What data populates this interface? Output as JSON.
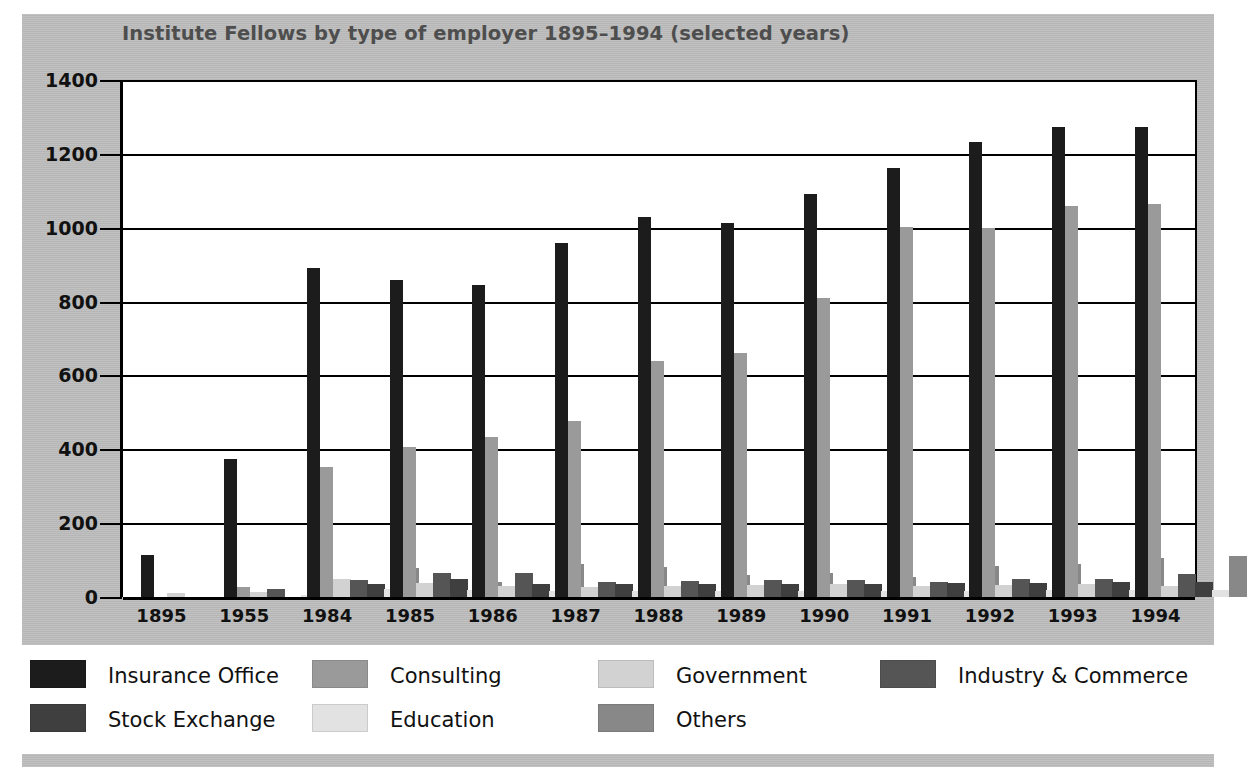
{
  "chart_data": {
    "type": "bar",
    "title": "Institute Fellows by type of employer 1895–1994 (selected years)",
    "xlabel": "",
    "ylabel": "",
    "ylim": [
      0,
      1400
    ],
    "ytick_step": 200,
    "yticks": [
      "0",
      "200",
      "400",
      "600",
      "800",
      "1000",
      "1200",
      "1400"
    ],
    "grid": true,
    "legend_position": "bottom",
    "categories": [
      "1895",
      "1955",
      "1984",
      "1985",
      "1986",
      "1987",
      "1988",
      "1989",
      "1990",
      "1991",
      "1992",
      "1993",
      "1994"
    ],
    "series": [
      {
        "name": "Insurance Office",
        "color": "#1c1c1c",
        "texture": "dark",
        "values": [
          115,
          375,
          890,
          858,
          845,
          958,
          1030,
          1013,
          1090,
          1163,
          1232,
          1272,
          1273
        ]
      },
      {
        "name": "Consulting",
        "color": "#9a9a9a",
        "texture": "mid",
        "values": [
          0,
          26,
          352,
          405,
          432,
          477,
          640,
          662,
          810,
          1003,
          1000,
          1060,
          1065
        ]
      },
      {
        "name": "Government",
        "color": "#d2d2d2",
        "texture": "none",
        "values": [
          10,
          14,
          50,
          38,
          30,
          27,
          30,
          32,
          34,
          30,
          32,
          35,
          30
        ]
      },
      {
        "name": "Industry & Commerce",
        "color": "#555555",
        "texture": "mid",
        "values": [
          0,
          22,
          46,
          65,
          66,
          40,
          43,
          45,
          45,
          40,
          48,
          50,
          62
        ]
      },
      {
        "name": "Stock Exchange",
        "color": "#3f3f3f",
        "texture": "mid",
        "values": [
          0,
          0,
          36,
          48,
          36,
          34,
          35,
          36,
          36,
          38,
          37,
          40,
          42
        ]
      },
      {
        "name": "Education",
        "color": "#e2e2e2",
        "texture": "none",
        "values": [
          0,
          6,
          22,
          18,
          17,
          16,
          16,
          16,
          16,
          16,
          18,
          18,
          18
        ]
      },
      {
        "name": "Others",
        "color": "#888888",
        "texture": "mid",
        "values": [
          0,
          9,
          78,
          42,
          90,
          80,
          60,
          64,
          55,
          85,
          90,
          105,
          112
        ]
      }
    ]
  },
  "legend": {
    "items": [
      {
        "label": "Insurance Office",
        "color": "#1c1c1c",
        "texture": "dark"
      },
      {
        "label": "Consulting",
        "color": "#9a9a9a",
        "texture": "mid"
      },
      {
        "label": "Government",
        "color": "#d2d2d2",
        "texture": "none"
      },
      {
        "label": "Industry & Commerce",
        "color": "#555555",
        "texture": "mid"
      },
      {
        "label": "Stock Exchange",
        "color": "#3f3f3f",
        "texture": "mid"
      },
      {
        "label": "Education",
        "color": "#e2e2e2",
        "texture": "none"
      },
      {
        "label": "Others",
        "color": "#888888",
        "texture": "mid"
      }
    ]
  },
  "theme": {
    "panel_bg": "#bdbdbd",
    "plot_bg": "#ffffff",
    "axis_color": "#000000",
    "title_color": "#4e4e4e",
    "label_color": "#111111"
  }
}
